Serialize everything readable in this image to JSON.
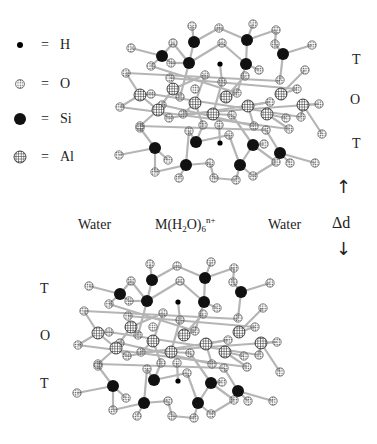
{
  "legend": [
    {
      "symbol": "hydrogen-dot",
      "equals": "=",
      "label": "H"
    },
    {
      "symbol": "oxygen-dotted-circle",
      "equals": "=",
      "label": "O"
    },
    {
      "symbol": "silicon-black-circle",
      "equals": "=",
      "label": "Si"
    },
    {
      "symbol": "aluminum-checkered-circle",
      "equals": "=",
      "label": "Al"
    }
  ],
  "layers": {
    "top": [
      "T",
      "O",
      "T"
    ],
    "bottom": [
      "T",
      "O",
      "T"
    ]
  },
  "interlayer": {
    "left": "Water",
    "center_main": "M(H",
    "center_sub1": "2",
    "center_mid": "O)",
    "center_sub2": "6",
    "center_sup": "n+",
    "right": "Water",
    "spacing_label": "Δd",
    "arrow_up": "↑",
    "arrow_down": "↓"
  },
  "colors": {
    "bond": "#b5b5b5",
    "silicon": "#111111",
    "oxygen_fill": "#ffffff",
    "oxygen_dots": "#555555",
    "aluminum_fill": "#ffffff",
    "aluminum_grid": "#222222",
    "hydrogen": "#000000"
  },
  "structure": {
    "bottom_offset": [
      -42,
      238
    ],
    "si": [
      [
        194,
        42
      ],
      [
        247,
        40
      ],
      [
        162,
        56
      ],
      [
        189,
        63
      ],
      [
        246,
        64
      ],
      [
        283,
        54
      ],
      [
        196,
        142
      ],
      [
        253,
        145
      ],
      [
        155,
        148
      ],
      [
        186,
        165
      ],
      [
        240,
        165
      ],
      [
        280,
        153
      ]
    ],
    "al": [
      [
        140,
        95
      ],
      [
        173,
        89
      ],
      [
        158,
        110
      ],
      [
        195,
        103
      ],
      [
        213,
        114
      ],
      [
        226,
        97
      ],
      [
        248,
        106
      ],
      [
        267,
        114
      ],
      [
        281,
        94
      ],
      [
        303,
        105
      ]
    ],
    "h": [
      [
        220,
        64
      ],
      [
        220,
        143
      ]
    ],
    "o": [
      [
        192,
        26
      ],
      [
        253,
        24
      ],
      [
        219,
        28
      ],
      [
        276,
        30
      ],
      [
        131,
        48
      ],
      [
        173,
        43
      ],
      [
        222,
        43
      ],
      [
        275,
        44
      ],
      [
        312,
        45
      ],
      [
        171,
        63
      ],
      [
        151,
        66
      ],
      [
        259,
        70
      ],
      [
        126,
        73
      ],
      [
        305,
        70
      ],
      [
        205,
        75
      ],
      [
        280,
        80
      ],
      [
        222,
        82
      ],
      [
        170,
        78
      ],
      [
        245,
        76
      ],
      [
        297,
        89
      ],
      [
        120,
        107
      ],
      [
        151,
        94
      ],
      [
        195,
        89
      ],
      [
        237,
        93
      ],
      [
        140,
        126
      ],
      [
        180,
        97
      ],
      [
        162,
        105
      ],
      [
        183,
        114
      ],
      [
        203,
        125
      ],
      [
        232,
        115
      ],
      [
        254,
        126
      ],
      [
        270,
        102
      ],
      [
        286,
        118
      ],
      [
        301,
        117
      ],
      [
        319,
        104
      ],
      [
        140,
        128
      ],
      [
        169,
        118
      ],
      [
        189,
        131
      ],
      [
        219,
        125
      ],
      [
        266,
        130
      ],
      [
        289,
        129
      ],
      [
        322,
        134
      ],
      [
        119,
        155
      ],
      [
        168,
        160
      ],
      [
        155,
        172
      ],
      [
        179,
        178
      ],
      [
        210,
        163
      ],
      [
        229,
        135
      ],
      [
        236,
        180
      ],
      [
        264,
        144
      ],
      [
        276,
        162
      ],
      [
        290,
        163
      ],
      [
        214,
        178
      ],
      [
        253,
        176
      ],
      [
        315,
        163
      ]
    ],
    "bonds": [
      [
        [
          192,
          26
        ],
        [
          194,
          42
        ]
      ],
      [
        [
          194,
          42
        ],
        [
          219,
          28
        ]
      ],
      [
        [
          219,
          28
        ],
        [
          247,
          40
        ]
      ],
      [
        [
          247,
          40
        ],
        [
          253,
          24
        ]
      ],
      [
        [
          247,
          40
        ],
        [
          276,
          30
        ]
      ],
      [
        [
          276,
          30
        ],
        [
          275,
          44
        ]
      ],
      [
        [
          275,
          44
        ],
        [
          283,
          54
        ]
      ],
      [
        [
          283,
          54
        ],
        [
          312,
          45
        ]
      ],
      [
        [
          194,
          42
        ],
        [
          189,
          63
        ]
      ],
      [
        [
          173,
          43
        ],
        [
          162,
          56
        ]
      ],
      [
        [
          131,
          48
        ],
        [
          162,
          56
        ]
      ],
      [
        [
          162,
          56
        ],
        [
          171,
          63
        ]
      ],
      [
        [
          162,
          56
        ],
        [
          151,
          66
        ]
      ],
      [
        [
          171,
          63
        ],
        [
          189,
          63
        ]
      ],
      [
        [
          173,
          43
        ],
        [
          189,
          63
        ]
      ],
      [
        [
          189,
          63
        ],
        [
          222,
          43
        ]
      ],
      [
        [
          222,
          43
        ],
        [
          246,
          64
        ]
      ],
      [
        [
          247,
          40
        ],
        [
          246,
          64
        ]
      ],
      [
        [
          246,
          64
        ],
        [
          259,
          70
        ]
      ],
      [
        [
          283,
          54
        ],
        [
          280,
          80
        ]
      ],
      [
        [
          246,
          64
        ],
        [
          237,
          93
        ]
      ],
      [
        [
          189,
          63
        ],
        [
          180,
          97
        ]
      ],
      [
        [
          220,
          64
        ],
        [
          222,
          82
        ]
      ],
      [
        [
          126,
          73
        ],
        [
          140,
          95
        ]
      ],
      [
        [
          140,
          95
        ],
        [
          151,
          94
        ]
      ],
      [
        [
          140,
          95
        ],
        [
          120,
          107
        ]
      ],
      [
        [
          140,
          95
        ],
        [
          158,
          110
        ]
      ],
      [
        [
          158,
          110
        ],
        [
          140,
          126
        ]
      ],
      [
        [
          158,
          110
        ],
        [
          169,
          118
        ]
      ],
      [
        [
          158,
          110
        ],
        [
          173,
          89
        ]
      ],
      [
        [
          173,
          89
        ],
        [
          180,
          97
        ]
      ],
      [
        [
          173,
          89
        ],
        [
          205,
          75
        ]
      ],
      [
        [
          195,
          103
        ],
        [
          183,
          114
        ]
      ],
      [
        [
          195,
          103
        ],
        [
          205,
          75
        ]
      ],
      [
        [
          195,
          103
        ],
        [
          203,
          125
        ]
      ],
      [
        [
          213,
          114
        ],
        [
          222,
          82
        ]
      ],
      [
        [
          213,
          114
        ],
        [
          232,
          115
        ]
      ],
      [
        [
          226,
          97
        ],
        [
          237,
          93
        ]
      ],
      [
        [
          226,
          97
        ],
        [
          245,
          76
        ]
      ],
      [
        [
          248,
          106
        ],
        [
          254,
          126
        ]
      ],
      [
        [
          248,
          106
        ],
        [
          270,
          102
        ]
      ],
      [
        [
          267,
          114
        ],
        [
          286,
          118
        ]
      ],
      [
        [
          281,
          94
        ],
        [
          297,
          89
        ]
      ],
      [
        [
          281,
          94
        ],
        [
          305,
          70
        ]
      ],
      [
        [
          303,
          105
        ],
        [
          319,
          104
        ]
      ],
      [
        [
          303,
          105
        ],
        [
          301,
          117
        ]
      ],
      [
        [
          303,
          105
        ],
        [
          322,
          134
        ]
      ],
      [
        [
          267,
          114
        ],
        [
          289,
          129
        ]
      ],
      [
        [
          151,
          66
        ],
        [
          237,
          93
        ]
      ],
      [
        [
          170,
          78
        ],
        [
          297,
          89
        ]
      ],
      [
        [
          126,
          73
        ],
        [
          280,
          81
        ]
      ],
      [
        [
          120,
          107
        ],
        [
          289,
          129
        ]
      ],
      [
        [
          140,
          126
        ],
        [
          266,
          130
        ]
      ],
      [
        [
          151,
          94
        ],
        [
          301,
          117
        ]
      ],
      [
        [
          162,
          105
        ],
        [
          254,
          126
        ]
      ],
      [
        [
          183,
          114
        ],
        [
          319,
          104
        ]
      ],
      [
        [
          169,
          118
        ],
        [
          270,
          102
        ]
      ],
      [
        [
          140,
          128
        ],
        [
          155,
          148
        ]
      ],
      [
        [
          155,
          148
        ],
        [
          119,
          155
        ]
      ],
      [
        [
          155,
          148
        ],
        [
          168,
          160
        ]
      ],
      [
        [
          155,
          148
        ],
        [
          155,
          172
        ]
      ],
      [
        [
          155,
          172
        ],
        [
          186,
          165
        ]
      ],
      [
        [
          186,
          165
        ],
        [
          179,
          178
        ]
      ],
      [
        [
          186,
          165
        ],
        [
          210,
          163
        ]
      ],
      [
        [
          210,
          163
        ],
        [
          214,
          178
        ]
      ],
      [
        [
          186,
          165
        ],
        [
          189,
          131
        ]
      ],
      [
        [
          196,
          142
        ],
        [
          189,
          131
        ]
      ],
      [
        [
          196,
          142
        ],
        [
          203,
          125
        ]
      ],
      [
        [
          196,
          142
        ],
        [
          229,
          135
        ]
      ],
      [
        [
          219,
          125
        ],
        [
          220,
          143
        ]
      ],
      [
        [
          240,
          165
        ],
        [
          229,
          135
        ]
      ],
      [
        [
          240,
          165
        ],
        [
          236,
          180
        ]
      ],
      [
        [
          240,
          165
        ],
        [
          253,
          145
        ]
      ],
      [
        [
          253,
          145
        ],
        [
          264,
          144
        ]
      ],
      [
        [
          253,
          145
        ],
        [
          232,
          115
        ]
      ],
      [
        [
          253,
          145
        ],
        [
          276,
          162
        ]
      ],
      [
        [
          280,
          153
        ],
        [
          290,
          163
        ]
      ],
      [
        [
          280,
          153
        ],
        [
          315,
          163
        ]
      ],
      [
        [
          280,
          153
        ],
        [
          266,
          130
        ]
      ],
      [
        [
          240,
          165
        ],
        [
          253,
          176
        ]
      ],
      [
        [
          253,
          176
        ],
        [
          276,
          162
        ]
      ],
      [
        [
          236,
          180
        ],
        [
          214,
          178
        ]
      ]
    ]
  }
}
